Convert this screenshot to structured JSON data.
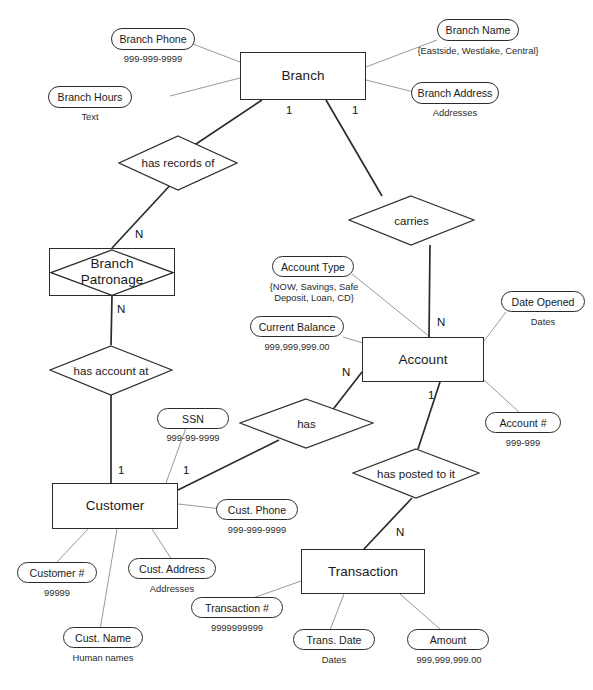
{
  "diagram": {
    "entities": [
      {
        "name": "branch",
        "label": "Branch"
      },
      {
        "name": "branch-patronage",
        "label": "Branch\nPatronage"
      },
      {
        "name": "account",
        "label": "Account"
      },
      {
        "name": "customer",
        "label": "Customer"
      },
      {
        "name": "transaction",
        "label": "Transaction"
      }
    ],
    "relationships": [
      {
        "name": "has-records-of",
        "label": "has records of"
      },
      {
        "name": "carries",
        "label": "carries"
      },
      {
        "name": "has-account-at",
        "label": "has account at"
      },
      {
        "name": "has",
        "label": "has"
      },
      {
        "name": "has-posted-to-it",
        "label": "has posted to it"
      }
    ],
    "attributes": [
      {
        "name": "branch-phone",
        "label": "Branch Phone",
        "domain": "999-999-9999"
      },
      {
        "name": "branch-hours",
        "label": "Branch Hours",
        "domain": "Text"
      },
      {
        "name": "branch-name",
        "label": "Branch Name",
        "domain": "{Eastside, Westlake, Central}"
      },
      {
        "name": "branch-address",
        "label": "Branch Address",
        "domain": "Addresses"
      },
      {
        "name": "account-type",
        "label": "Account Type",
        "domain": "{NOW, Savings, Safe\nDeposit, Loan, CD}"
      },
      {
        "name": "current-balance",
        "label": "Current Balance",
        "domain": "999,999,999.00"
      },
      {
        "name": "date-opened",
        "label": "Date Opened",
        "domain": "Dates"
      },
      {
        "name": "account-number",
        "label": "Account #",
        "domain": "999-999"
      },
      {
        "name": "ssn",
        "label": "SSN",
        "domain": "999-99-9999"
      },
      {
        "name": "customer-number",
        "label": "Customer #",
        "domain": "99999"
      },
      {
        "name": "cust-name",
        "label": "Cust. Name",
        "domain": "Human names"
      },
      {
        "name": "cust-address",
        "label": "Cust. Address",
        "domain": "Addresses"
      },
      {
        "name": "cust-phone",
        "label": "Cust. Phone",
        "domain": "999-999-9999"
      },
      {
        "name": "transaction-number",
        "label": "Transaction #",
        "domain": "9999999999"
      },
      {
        "name": "trans-date",
        "label": "Trans. Date",
        "domain": "Dates"
      },
      {
        "name": "amount",
        "label": "Amount",
        "domain": "999,999,999.00"
      }
    ],
    "cardinalities": [
      {
        "name": "branch-to-has-records-of",
        "value": "1"
      },
      {
        "name": "branch-to-carries",
        "value": "1"
      },
      {
        "name": "has-records-of-to-patronage",
        "value": "N"
      },
      {
        "name": "patronage-to-has-account-at",
        "value": "N"
      },
      {
        "name": "carries-to-account",
        "value": "N"
      },
      {
        "name": "account-to-has",
        "value": "N"
      },
      {
        "name": "account-to-has-posted",
        "value": "1"
      },
      {
        "name": "has-account-at-to-customer",
        "value": "1"
      },
      {
        "name": "has-to-customer",
        "value": "1"
      },
      {
        "name": "has-posted-to-transaction",
        "value": "N"
      }
    ],
    "colors": {
      "line": "#2b2b2b",
      "thin_line": "#8d8d8d",
      "text": "#1a1a1a",
      "background": "#ffffff"
    }
  }
}
